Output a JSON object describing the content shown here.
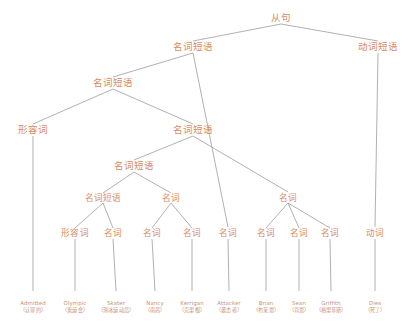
{
  "diagram": {
    "title": "从句",
    "type": "syntax-parse-tree",
    "text_color": "#d98a62",
    "leaf_color": "#c98f74",
    "edge_color": "#8f8f8f",
    "background": "#ffffff",
    "nodes": [
      {
        "id": "n0",
        "label": "从句",
        "x": 281,
        "y": 18,
        "size": "cat"
      },
      {
        "id": "n1",
        "label": "名词短语",
        "x": 193,
        "y": 47,
        "size": "cat"
      },
      {
        "id": "n2",
        "label": "动词短语",
        "x": 378,
        "y": 47,
        "size": "cat"
      },
      {
        "id": "n3",
        "label": "名词短语",
        "x": 113,
        "y": 83,
        "size": "cat"
      },
      {
        "id": "n4",
        "label": "形容词",
        "x": 33,
        "y": 130,
        "size": "cat"
      },
      {
        "id": "n5",
        "label": "名词短语",
        "x": 193,
        "y": 130,
        "size": "cat"
      },
      {
        "id": "n6",
        "label": "名词短语",
        "x": 134,
        "y": 166,
        "size": "cat"
      },
      {
        "id": "n7",
        "label": "名词短语",
        "x": 103,
        "y": 198,
        "size": "cat-sm"
      },
      {
        "id": "n8",
        "label": "名词",
        "x": 171,
        "y": 198,
        "size": "cat-sm"
      },
      {
        "id": "n9",
        "label": "名词",
        "x": 288,
        "y": 198,
        "size": "cat-sm"
      },
      {
        "id": "p1",
        "label": "形容词",
        "x": 75,
        "y": 233,
        "size": "cat-sm"
      },
      {
        "id": "p2",
        "label": "名词",
        "x": 113,
        "y": 233,
        "size": "cat-sm"
      },
      {
        "id": "p3",
        "label": "名词",
        "x": 152,
        "y": 233,
        "size": "cat-sm"
      },
      {
        "id": "p4",
        "label": "名词",
        "x": 192,
        "y": 233,
        "size": "cat-sm"
      },
      {
        "id": "p5",
        "label": "名词",
        "x": 228,
        "y": 233,
        "size": "cat-sm"
      },
      {
        "id": "p6",
        "label": "名词",
        "x": 266,
        "y": 233,
        "size": "cat-sm"
      },
      {
        "id": "p7",
        "label": "名词",
        "x": 299,
        "y": 233,
        "size": "cat-sm"
      },
      {
        "id": "p8",
        "label": "名词",
        "x": 330,
        "y": 233,
        "size": "cat-sm"
      },
      {
        "id": "p9",
        "label": "动词",
        "x": 375,
        "y": 233,
        "size": "cat-sm"
      }
    ],
    "leaves": [
      {
        "id": "l0",
        "word": "Admitted",
        "gloss": "（认罪的）",
        "x": 33,
        "y": 300
      },
      {
        "id": "l1",
        "word": "Olympic",
        "gloss": "（奥运会）",
        "x": 75,
        "y": 300
      },
      {
        "id": "l2",
        "word": "Skater",
        "gloss": "（滑冰运动员）",
        "x": 116,
        "y": 300
      },
      {
        "id": "l3",
        "word": "Nancy",
        "gloss": "（南茜）",
        "x": 155,
        "y": 300
      },
      {
        "id": "l4",
        "word": "Kerrigan",
        "gloss": "（克里根）",
        "x": 192,
        "y": 300
      },
      {
        "id": "l5",
        "word": "Attacker",
        "gloss": "（袭击者）",
        "x": 229,
        "y": 300
      },
      {
        "id": "l6",
        "word": "Brian",
        "gloss": "（布莱恩）",
        "x": 266,
        "y": 300
      },
      {
        "id": "l7",
        "word": "Sean",
        "gloss": "（肖恩）",
        "x": 299,
        "y": 300
      },
      {
        "id": "l8",
        "word": "Griffith",
        "gloss": "（格里菲斯）",
        "x": 331,
        "y": 300
      },
      {
        "id": "l9",
        "word": "Dies",
        "gloss": "（死了）",
        "x": 375,
        "y": 300
      }
    ],
    "edges": [
      {
        "from": [
          281,
          24
        ],
        "to": [
          193,
          41
        ]
      },
      {
        "from": [
          281,
          24
        ],
        "to": [
          378,
          41
        ]
      },
      {
        "from": [
          193,
          53
        ],
        "to": [
          113,
          77
        ]
      },
      {
        "from": [
          193,
          53
        ],
        "to": [
          228,
          227
        ]
      },
      {
        "from": [
          378,
          53
        ],
        "to": [
          375,
          227
        ]
      },
      {
        "from": [
          113,
          89
        ],
        "to": [
          33,
          124
        ]
      },
      {
        "from": [
          113,
          89
        ],
        "to": [
          193,
          124
        ]
      },
      {
        "from": [
          33,
          136
        ],
        "to": [
          33,
          291
        ]
      },
      {
        "from": [
          193,
          136
        ],
        "to": [
          134,
          160
        ]
      },
      {
        "from": [
          193,
          136
        ],
        "to": [
          288,
          192
        ]
      },
      {
        "from": [
          134,
          172
        ],
        "to": [
          103,
          193
        ]
      },
      {
        "from": [
          134,
          172
        ],
        "to": [
          171,
          193
        ]
      },
      {
        "from": [
          103,
          203
        ],
        "to": [
          75,
          228
        ]
      },
      {
        "from": [
          103,
          203
        ],
        "to": [
          113,
          228
        ]
      },
      {
        "from": [
          171,
          203
        ],
        "to": [
          152,
          228
        ]
      },
      {
        "from": [
          171,
          203
        ],
        "to": [
          192,
          228
        ]
      },
      {
        "from": [
          288,
          203
        ],
        "to": [
          266,
          228
        ]
      },
      {
        "from": [
          288,
          203
        ],
        "to": [
          299,
          228
        ]
      },
      {
        "from": [
          288,
          203
        ],
        "to": [
          330,
          228
        ]
      },
      {
        "from": [
          75,
          239
        ],
        "to": [
          75,
          291
        ]
      },
      {
        "from": [
          113,
          239
        ],
        "to": [
          116,
          291
        ]
      },
      {
        "from": [
          152,
          239
        ],
        "to": [
          155,
          291
        ]
      },
      {
        "from": [
          192,
          239
        ],
        "to": [
          192,
          291
        ]
      },
      {
        "from": [
          228,
          239
        ],
        "to": [
          229,
          291
        ]
      },
      {
        "from": [
          266,
          239
        ],
        "to": [
          266,
          291
        ]
      },
      {
        "from": [
          299,
          239
        ],
        "to": [
          299,
          291
        ]
      },
      {
        "from": [
          330,
          239
        ],
        "to": [
          331,
          291
        ]
      },
      {
        "from": [
          375,
          239
        ],
        "to": [
          375,
          291
        ]
      }
    ]
  }
}
